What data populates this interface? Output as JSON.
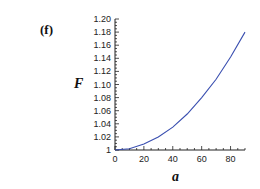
{
  "panel_label": "(f)",
  "chart_data": {
    "type": "line",
    "title": "",
    "xlabel": "a",
    "ylabel": "F",
    "xlim": [
      0,
      90
    ],
    "ylim": [
      1.0,
      1.2
    ],
    "x_ticks": [
      0,
      20,
      40,
      60,
      80
    ],
    "y_ticks": [
      "1",
      "1.02",
      "1.04",
      "1.06",
      "1.08",
      "1.10",
      "1.12",
      "1.14",
      "1.16",
      "1.18",
      "1.20"
    ],
    "grid": false,
    "legend": null,
    "series": [
      {
        "name": "F(a)",
        "color": "#3a4fb0",
        "x": [
          0,
          10,
          20,
          30,
          40,
          50,
          60,
          70,
          80,
          90
        ],
        "y": [
          1.0,
          1.002,
          1.009,
          1.02,
          1.035,
          1.055,
          1.08,
          1.108,
          1.142,
          1.18
        ]
      }
    ]
  }
}
